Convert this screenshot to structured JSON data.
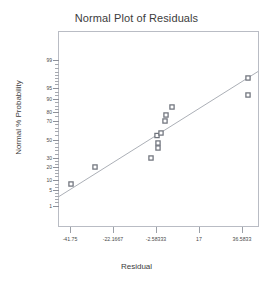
{
  "chart_data": {
    "type": "scatter",
    "title": "Normal Plot of Residuals",
    "xlabel": "Residual",
    "ylabel": "Normal % Probability",
    "grid": false,
    "legend": null,
    "xlim": [
      -41.75,
      36.5833
    ],
    "x_ticks": [
      "-41.75",
      "-22.1667",
      "-2.58333",
      "17",
      "36.5833"
    ],
    "x_tick_values": [
      -41.75,
      -22.1667,
      -2.58333,
      17,
      36.5833
    ],
    "y_scale": "normal-probability",
    "y_ticks": [
      "99",
      "95",
      "90",
      "80",
      "70",
      "50",
      "30",
      "20",
      "10",
      "5",
      "1"
    ],
    "y_tick_values": [
      99,
      95,
      90,
      80,
      70,
      50,
      30,
      20,
      10,
      5,
      1
    ],
    "series": [
      {
        "name": "Residuals",
        "marker": "square",
        "marker_color": "#8c8f98",
        "points": [
          {
            "x": -41.0,
            "y": 4.2
          },
          {
            "x": -30.2,
            "y": 12.5
          },
          {
            "x": -4.7,
            "y": 20.0
          },
          {
            "x": -1.5,
            "y": 29.5
          },
          {
            "x": -1.5,
            "y": 35.0
          },
          {
            "x": -1.9,
            "y": 44.0
          },
          {
            "x": -0.1,
            "y": 48.0
          },
          {
            "x": 1.7,
            "y": 56.5
          },
          {
            "x": 2.2,
            "y": 65.0
          },
          {
            "x": 4.9,
            "y": 75.0
          },
          {
            "x": 39.6,
            "y": 95.5
          },
          {
            "x": 39.6,
            "y": 87.5
          }
        ]
      }
    ],
    "reference_line": {
      "name": "Normal reference line",
      "color": "#9fa3ab",
      "start": {
        "x": -42.6,
        "y": 2.5
      },
      "end": {
        "x": 48.3,
        "y": 97.5
      }
    }
  },
  "axes": {
    "y_ticks": [
      {
        "label": "99",
        "pos": 60.0
      },
      {
        "label": "95",
        "pos": 88.0
      },
      {
        "label": "90",
        "pos": 98.5
      },
      {
        "label": "80",
        "pos": 112.0
      },
      {
        "label": "70",
        "pos": 120.5
      },
      {
        "label": "50",
        "pos": 139.5
      },
      {
        "label": "30",
        "pos": 157.5
      },
      {
        "label": "20",
        "pos": 166.5
      },
      {
        "label": "10",
        "pos": 180.0
      },
      {
        "label": "5",
        "pos": 190.0
      },
      {
        "label": "1",
        "pos": 206.0
      }
    ],
    "y_minor_positions": [
      64,
      68,
      71.5,
      75,
      78,
      81,
      84,
      92,
      95,
      102,
      105.5,
      108.5,
      116,
      124,
      127.5,
      131,
      134.5,
      143,
      146.5,
      150,
      153.5,
      161,
      163.5,
      169.5,
      172.5,
      175.5,
      184,
      187,
      193,
      196,
      199,
      202
    ],
    "x_ticks": [
      {
        "label": "-41.75",
        "pos": 70.0
      },
      {
        "label": "-22.1667",
        "pos": 113.0
      },
      {
        "label": "-2.58333",
        "pos": 156.0
      },
      {
        "label": "17",
        "pos": 199.0
      },
      {
        "label": "36.5833",
        "pos": 242.0
      }
    ]
  },
  "markers": [
    {
      "cx": 71.0,
      "cy": 184.0
    },
    {
      "cx": 95.0,
      "cy": 167.0
    },
    {
      "cx": 151.0,
      "cy": 158.0
    },
    {
      "cx": 158.0,
      "cy": 148.0
    },
    {
      "cx": 158.0,
      "cy": 143.0
    },
    {
      "cx": 157.0,
      "cy": 135.5
    },
    {
      "cx": 161.0,
      "cy": 133.0
    },
    {
      "cx": 165.0,
      "cy": 121.0
    },
    {
      "cx": 166.0,
      "cy": 115.0
    },
    {
      "cx": 172.0,
      "cy": 107.0
    },
    {
      "cx": 248.0,
      "cy": 78.0
    },
    {
      "cx": 248.0,
      "cy": 95.0
    }
  ],
  "line_pixels": {
    "x1": 59.0,
    "y1": 196.5,
    "x2": 258.0,
    "y2": 71.5
  },
  "colors": {
    "marker_fill": "#b3b6bd",
    "marker_stroke": "#6f737c",
    "line": "#a2a6ae",
    "frame": "#b9bcc4",
    "text": "#3c3c3c",
    "background": "#ffffff"
  }
}
